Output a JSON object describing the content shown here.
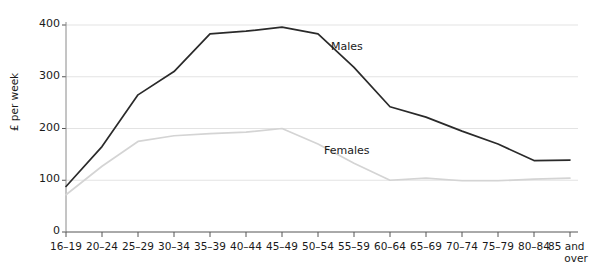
{
  "chart_data": {
    "type": "line",
    "title": "",
    "xlabel": "",
    "ylabel": "£ per week",
    "ylim": [
      0,
      430
    ],
    "yticks": [
      0,
      100,
      200,
      300,
      400
    ],
    "ytick_labels": [
      "0",
      "100",
      "200",
      "300",
      "400"
    ],
    "grid": "horizontal",
    "legend": "inline-labels",
    "categories": [
      "16–19",
      "20–24",
      "25–29",
      "30–34",
      "35–39",
      "40–44",
      "45–49",
      "50–54",
      "55–59",
      "60–64",
      "65–69",
      "70–74",
      "75–79",
      "80–84",
      "85 and over"
    ],
    "category_labels_multiline": {
      "85 and over": [
        "85 and",
        "over"
      ]
    },
    "series": [
      {
        "name": "Males",
        "color": "#2a2a2a",
        "values": [
          88,
          165,
          265,
          310,
          383,
          388,
          396,
          383,
          318,
          242,
          222,
          195,
          170,
          138,
          139
        ]
      },
      {
        "name": "Females",
        "color": "#d4d4d4",
        "values": [
          72,
          127,
          175,
          186,
          190,
          193,
          200,
          170,
          133,
          100,
          104,
          99,
          99,
          102,
          104
        ]
      }
    ],
    "annotations": [
      {
        "text": "Males",
        "x_px": 331,
        "y_px": 40
      },
      {
        "text": "Females",
        "x_px": 324,
        "y_px": 144
      }
    ]
  }
}
